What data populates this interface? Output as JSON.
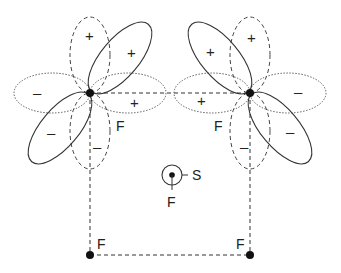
{
  "diagram": {
    "colors": {
      "line": "#333333",
      "atom": "#111111",
      "background": "#ffffff"
    },
    "atoms": [
      {
        "id": "F_top_left",
        "label": "F",
        "x": 90,
        "y": 93
      },
      {
        "id": "F_top_right",
        "label": "F",
        "x": 250,
        "y": 93
      },
      {
        "id": "F_bottom_left",
        "label": "F",
        "x": 90,
        "y": 255
      },
      {
        "id": "F_bottom_right",
        "label": "F",
        "x": 250,
        "y": 255
      },
      {
        "id": "S_center",
        "label": "S",
        "x": 172,
        "y": 175
      },
      {
        "id": "F_center_axial",
        "label": "F",
        "x": 172,
        "y": 175
      }
    ],
    "labels": {
      "f_top_left": "F",
      "f_top_right": "F",
      "f_bottom_left": "F",
      "f_bottom_right": "F",
      "s_center": "S",
      "f_center": "F"
    },
    "signs": {
      "left_vertical_top": "+",
      "left_vertical_bottom": "–",
      "left_horizontal_left": "–",
      "left_horizontal_right": "+",
      "left_diagonal_upper": "+",
      "left_diagonal_lower": "–",
      "right_vertical_top": "+",
      "right_vertical_bottom": "–",
      "right_horizontal_left": "+",
      "right_horizontal_right": "–",
      "right_diagonal_upper": "+",
      "right_diagonal_lower": "–"
    },
    "legend_styles": {
      "solid": "diagonal lobes",
      "dashed": "vertical lobes and bonds",
      "dotted": "horizontal lobes"
    }
  }
}
